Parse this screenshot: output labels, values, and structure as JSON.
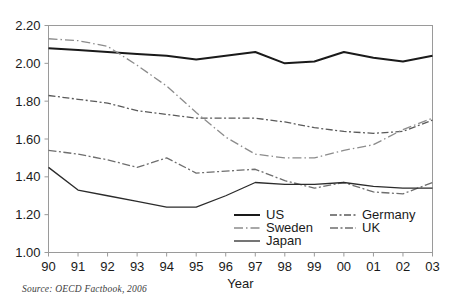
{
  "source_note": "Source:  OECD Factbook, 2006",
  "axes": {
    "xlabel": "Year",
    "ylabel": "",
    "y_ticks": [
      "1.00",
      "1.20",
      "1.40",
      "1.60",
      "1.80",
      "2.00",
      "2.20"
    ],
    "x_ticks": [
      "90",
      "91",
      "92",
      "93",
      "94",
      "95",
      "96",
      "97",
      "98",
      "99",
      "00",
      "01",
      "02",
      "03"
    ]
  },
  "legend": {
    "entries": [
      {
        "label": "US",
        "style": "solid-thick"
      },
      {
        "label": "Germany",
        "style": "dashed"
      },
      {
        "label": "Sweden",
        "style": "dash-dot-light"
      },
      {
        "label": "UK",
        "style": "dash-dot"
      },
      {
        "label": "Japan",
        "style": "dash-dot-dot"
      }
    ]
  },
  "colors": {
    "us": "#1a1a1a",
    "germany": "#5a5a5a",
    "sweden": "#8c8c8c",
    "uk": "#6e6e6e",
    "japan": "#2b2b2b",
    "axis": "#9a9a9a",
    "text": "#1a1a1a"
  },
  "chart_data": {
    "type": "line",
    "title": "",
    "xlabel": "Year",
    "ylabel": "",
    "categories": [
      "90",
      "91",
      "92",
      "93",
      "94",
      "95",
      "96",
      "97",
      "98",
      "99",
      "00",
      "01",
      "02",
      "03"
    ],
    "xlim": [
      0,
      13
    ],
    "ylim": [
      1.0,
      2.2
    ],
    "grid": false,
    "legend_position": "inside-lower-right",
    "series": [
      {
        "name": "US",
        "style": "solid-thick",
        "values": [
          2.08,
          2.07,
          2.06,
          2.05,
          2.04,
          2.02,
          2.04,
          2.06,
          2.0,
          2.01,
          2.06,
          2.03,
          2.01,
          2.04
        ]
      },
      {
        "name": "Germany",
        "style": "dashed",
        "values": [
          1.83,
          1.81,
          1.79,
          1.75,
          1.73,
          1.71,
          1.71,
          1.71,
          1.69,
          1.66,
          1.64,
          1.63,
          1.64,
          1.7
        ]
      },
      {
        "name": "Sweden",
        "style": "dash-dot-light",
        "values": [
          2.13,
          2.12,
          2.09,
          1.99,
          1.88,
          1.74,
          1.61,
          1.52,
          1.5,
          1.5,
          1.54,
          1.57,
          1.65,
          1.71
        ]
      },
      {
        "name": "UK",
        "style": "dash-dot",
        "values": [
          1.54,
          1.52,
          1.49,
          1.45,
          1.5,
          1.42,
          1.43,
          1.44,
          1.38,
          1.34,
          1.37,
          1.32,
          1.31,
          1.37
        ]
      },
      {
        "name": "Japan",
        "style": "dash-dot-dot",
        "values": [
          1.45,
          1.33,
          1.3,
          1.27,
          1.24,
          1.24,
          1.3,
          1.37,
          1.36,
          1.36,
          1.37,
          1.35,
          1.34,
          1.34
        ]
      }
    ]
  }
}
